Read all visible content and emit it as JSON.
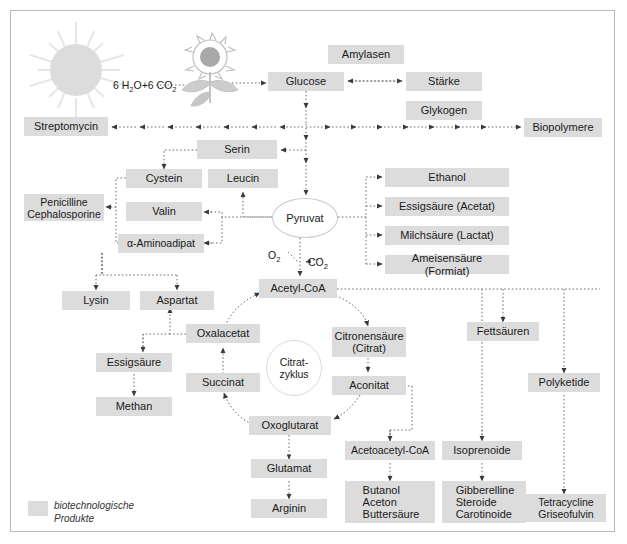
{
  "diagram": {
    "equation_inputs": "6 H2O+6 CO2",
    "gas_o2": "O2",
    "gas_co2": "CO2",
    "legend": {
      "swatch_color": "#dcdcdc",
      "text": "biotechnologische\nProdukte"
    },
    "colors": {
      "box_fill": "#dcdcdc",
      "frame_border": "#b8b8b8",
      "line": "#6e6e6e",
      "background": "#ffffff",
      "sun_fill": "#dcdcdc",
      "flower_center": "#a8a8a8"
    },
    "icons": [
      {
        "name": "sun-icon",
        "label": "sun"
      },
      {
        "name": "sunflower-plant-icon",
        "label": "sunflower plant"
      }
    ],
    "nodes": [
      {
        "id": "glucose",
        "label": "Glucose",
        "x": 268,
        "y": 72,
        "w": 76,
        "h": 19
      },
      {
        "id": "amylasen",
        "label": "Amylasen",
        "x": 328,
        "y": 45,
        "w": 76,
        "h": 19
      },
      {
        "id": "staerke",
        "label": "Stärke",
        "x": 406,
        "y": 72,
        "w": 76,
        "h": 19
      },
      {
        "id": "glykogen",
        "label": "Glykogen",
        "x": 406,
        "y": 101,
        "w": 76,
        "h": 19
      },
      {
        "id": "biopolymere",
        "label": "Biopolymere",
        "x": 524,
        "y": 128,
        "w": 78,
        "h": 19
      },
      {
        "id": "streptomycin",
        "label": "Streptomycin",
        "x": 24,
        "y": 117,
        "w": 84,
        "h": 19
      },
      {
        "id": "serin",
        "label": "Serin",
        "x": 197,
        "y": 140,
        "w": 80,
        "h": 19
      },
      {
        "id": "cystein",
        "label": "Cystein",
        "x": 126,
        "y": 172,
        "w": 76,
        "h": 19
      },
      {
        "id": "leucin",
        "label": "Leucin",
        "x": 208,
        "y": 172,
        "w": 70,
        "h": 19
      },
      {
        "id": "valin",
        "label": "Valin",
        "x": 126,
        "y": 203,
        "w": 76,
        "h": 19
      },
      {
        "id": "aminoadipat",
        "label": "α-Aminoadipat",
        "x": 126,
        "y": 234,
        "w": 76,
        "h": 19
      },
      {
        "id": "penicilline",
        "label": "Penicilline\nCephalosporine",
        "x": 24,
        "y": 194,
        "w": 79,
        "h": 27
      },
      {
        "id": "pyruvat",
        "label": "Pyruvat",
        "x": 274,
        "y": 198,
        "w": 64,
        "h": 38
      },
      {
        "id": "ethanol",
        "label": "Ethanol",
        "x": 385,
        "y": 168,
        "w": 124,
        "h": 19
      },
      {
        "id": "essigsaeure_acetat",
        "label": "Essigsäure (Acetat)",
        "x": 385,
        "y": 197,
        "w": 124,
        "h": 19
      },
      {
        "id": "milchsaeure",
        "label": "Milchsäure (Lactat)",
        "x": 385,
        "y": 226,
        "w": 124,
        "h": 19
      },
      {
        "id": "ameisensaeure",
        "label": "Ameisensäure (Formiat)",
        "x": 385,
        "y": 254,
        "w": 124,
        "h": 19
      },
      {
        "id": "acetylcoa",
        "label": "Acetyl-CoA",
        "x": 259,
        "y": 279,
        "w": 76,
        "h": 19
      },
      {
        "id": "lysin",
        "label": "Lysin",
        "x": 62,
        "y": 293,
        "w": 68,
        "h": 19
      },
      {
        "id": "aspartat",
        "label": "Aspartat",
        "x": 140,
        "y": 293,
        "w": 74,
        "h": 19
      },
      {
        "id": "oxalacetat",
        "label": "Oxalacetat",
        "x": 186,
        "y": 326,
        "w": 74,
        "h": 19
      },
      {
        "id": "essigsaeure",
        "label": "Essigsäure",
        "x": 96,
        "y": 355,
        "w": 76,
        "h": 19
      },
      {
        "id": "methan",
        "label": "Methan",
        "x": 96,
        "y": 399,
        "w": 76,
        "h": 19
      },
      {
        "id": "succinat",
        "label": "Succinat",
        "x": 186,
        "y": 374,
        "w": 74,
        "h": 19
      },
      {
        "id": "oxoglutarat",
        "label": "Oxoglutarat",
        "x": 251,
        "y": 416,
        "w": 80,
        "h": 19
      },
      {
        "id": "citronensaeure",
        "label": "Citronensäure\n(Citrat)",
        "x": 332,
        "y": 329,
        "w": 72,
        "h": 29
      },
      {
        "id": "aconitat",
        "label": "Aconitat",
        "x": 332,
        "y": 376,
        "w": 72,
        "h": 19
      },
      {
        "id": "citratzyklus",
        "label": "Citrat-\nzyklus",
        "x": 266,
        "y": 340,
        "w": 54,
        "h": 54
      },
      {
        "id": "glutamat",
        "label": "Glutamat",
        "x": 251,
        "y": 462,
        "w": 76,
        "h": 19
      },
      {
        "id": "arginin",
        "label": "Arginin",
        "x": 251,
        "y": 502,
        "w": 76,
        "h": 19
      },
      {
        "id": "acetoacetylcoa",
        "label": "Acetoacetyl-CoA",
        "x": 347,
        "y": 444,
        "w": 86,
        "h": 19
      },
      {
        "id": "isoprenoide",
        "label": "Isoprenoide",
        "x": 444,
        "y": 444,
        "w": 76,
        "h": 19
      },
      {
        "id": "butanol",
        "label": "Butanol\nAceton\nButtersäure",
        "x": 347,
        "y": 484,
        "w": 86,
        "h": 38
      },
      {
        "id": "gibberelline",
        "label": "Gibberelline\nSteroide\nCarotinoide",
        "x": 444,
        "y": 484,
        "w": 80,
        "h": 38
      },
      {
        "id": "fettsaeuren",
        "label": "Fettsäuren",
        "x": 467,
        "y": 325,
        "w": 72,
        "h": 19
      },
      {
        "id": "polyketide",
        "label": "Polyketide",
        "x": 528,
        "y": 376,
        "w": 72,
        "h": 19
      },
      {
        "id": "tetracycline",
        "label": "Tetracycline\nGriseofulvin",
        "x": 528,
        "y": 497,
        "w": 78,
        "h": 27
      }
    ]
  }
}
